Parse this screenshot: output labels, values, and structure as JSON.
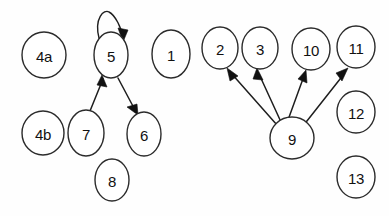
{
  "diagram": {
    "type": "node-link-diagram",
    "style": "hand-drawn scanned line art",
    "background_color": "#fefefe",
    "stroke_color": "#1e1e1e",
    "label_color": "#111111",
    "canvas": {
      "width": 389,
      "height": 216
    },
    "nodes": [
      {
        "id": "4a",
        "label": "4a",
        "cx": 44,
        "cy": 55,
        "rx": 22,
        "ry": 23
      },
      {
        "id": "5",
        "label": "5",
        "cx": 111,
        "cy": 55,
        "rx": 17,
        "ry": 23
      },
      {
        "id": "1",
        "label": "1",
        "cx": 171,
        "cy": 54,
        "rx": 19,
        "ry": 24
      },
      {
        "id": "4b",
        "label": "4b",
        "cx": 43,
        "cy": 133,
        "rx": 21,
        "ry": 22
      },
      {
        "id": "7",
        "label": "7",
        "cx": 86,
        "cy": 133,
        "rx": 18,
        "ry": 23
      },
      {
        "id": "6",
        "label": "6",
        "cx": 144,
        "cy": 134,
        "rx": 17,
        "ry": 22
      },
      {
        "id": "8",
        "label": "8",
        "cx": 112,
        "cy": 180,
        "rx": 17,
        "ry": 21
      },
      {
        "id": "2",
        "label": "2",
        "cx": 220,
        "cy": 48,
        "rx": 18,
        "ry": 21
      },
      {
        "id": "3",
        "label": "3",
        "cx": 260,
        "cy": 48,
        "rx": 18,
        "ry": 21
      },
      {
        "id": "10",
        "label": "10",
        "cx": 311,
        "cy": 49,
        "rx": 19,
        "ry": 21
      },
      {
        "id": "11",
        "label": "11",
        "cx": 356,
        "cy": 47,
        "rx": 19,
        "ry": 21
      },
      {
        "id": "9",
        "label": "9",
        "cx": 292,
        "cy": 138,
        "rx": 22,
        "ry": 21
      },
      {
        "id": "12",
        "label": "12",
        "cx": 356,
        "cy": 112,
        "rx": 19,
        "ry": 21
      },
      {
        "id": "13",
        "label": "13",
        "cx": 356,
        "cy": 177,
        "rx": 19,
        "ry": 21
      }
    ],
    "edges": [
      {
        "id": "e-5-5",
        "from": "5",
        "to": "5",
        "kind": "self-loop",
        "directed": true
      },
      {
        "id": "e-7-5",
        "from": "7",
        "to": "5",
        "kind": "straight",
        "directed": true
      },
      {
        "id": "e-5-6",
        "from": "5",
        "to": "6",
        "kind": "straight",
        "directed": true
      },
      {
        "id": "e-9-2",
        "from": "9",
        "to": "2",
        "kind": "straight",
        "directed": true
      },
      {
        "id": "e-9-3",
        "from": "9",
        "to": "3",
        "kind": "straight",
        "directed": true
      },
      {
        "id": "e-9-10",
        "from": "9",
        "to": "10",
        "kind": "straight",
        "directed": true
      },
      {
        "id": "e-9-11",
        "from": "9",
        "to": "11",
        "kind": "straight",
        "directed": true
      }
    ],
    "isolated_nodes": [
      "4a",
      "1",
      "4b",
      "8",
      "12",
      "13"
    ]
  }
}
